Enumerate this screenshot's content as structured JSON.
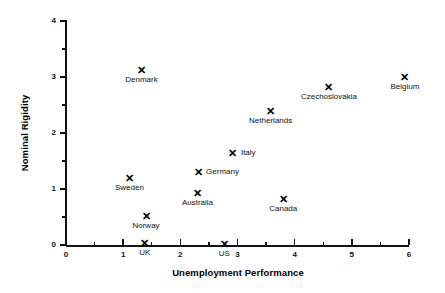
{
  "chart_data": {
    "type": "scatter",
    "title": "",
    "xlabel": "Unemployment Performance",
    "ylabel": "Nominal Rigidity",
    "xlim": [
      0,
      6
    ],
    "ylim": [
      0,
      4
    ],
    "xticks": [
      "0",
      "1",
      "2",
      "3",
      "4",
      "5",
      "6"
    ],
    "yticks": [
      "0",
      "1",
      "2",
      "3",
      "4"
    ],
    "xtick_minor": [
      0.5,
      1.5,
      2.5,
      3.5,
      4.5,
      5.5
    ],
    "ytick_minor": [
      0.5,
      1.5,
      2.5,
      3.5
    ],
    "grid": false,
    "legend": "none",
    "marker": "x",
    "points": [
      {
        "label": "Denmark",
        "x": 1.32,
        "y": 3.12,
        "label_pos": "below"
      },
      {
        "label": "Belgium",
        "x": 5.93,
        "y": 3.0,
        "label_pos": "below"
      },
      {
        "label": "Czechoslovakia",
        "x": 4.6,
        "y": 2.83,
        "label_pos": "below"
      },
      {
        "label": "Netherlands",
        "x": 3.58,
        "y": 2.4,
        "label_pos": "below"
      },
      {
        "label": "Italy",
        "x": 2.92,
        "y": 1.65,
        "label_pos": "right"
      },
      {
        "label": "Germany",
        "x": 2.31,
        "y": 1.3,
        "label_pos": "right"
      },
      {
        "label": "Sweden",
        "x": 1.11,
        "y": 1.2,
        "label_pos": "below"
      },
      {
        "label": "Australia",
        "x": 2.3,
        "y": 0.92,
        "label_pos": "below"
      },
      {
        "label": "Canada",
        "x": 3.8,
        "y": 0.82,
        "label_pos": "below"
      },
      {
        "label": "Norway",
        "x": 1.4,
        "y": 0.52,
        "label_pos": "below"
      },
      {
        "label": "UK",
        "x": 1.38,
        "y": 0.03,
        "label_pos": "below"
      },
      {
        "label": "US",
        "x": 2.77,
        "y": 0.02,
        "label_pos": "below"
      }
    ],
    "marker_glyph": "✕"
  },
  "colors": {
    "background": "#ffffff",
    "foreground": "#111111",
    "marker": "#000000"
  }
}
